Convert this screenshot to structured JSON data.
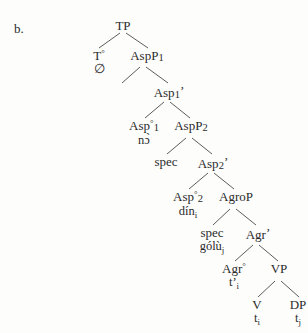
{
  "figure": {
    "example_label": "b.",
    "top_remnant": "",
    "type": "syntactic-tree"
  },
  "nodes": {
    "tp": {
      "label": "TP"
    },
    "t_head": {
      "label": "T",
      "degree": "°",
      "lexical": "∅"
    },
    "aspp1": {
      "label": "AspP",
      "number": "1"
    },
    "spec1": {
      "label": "spec"
    },
    "asp1bar": {
      "label": "Asp",
      "number": "1",
      "prime": "’"
    },
    "asp1_head": {
      "label": "Asp",
      "degree": "°",
      "number": "1",
      "lexical": "nɔ̀"
    },
    "aspp2": {
      "label": "AspP",
      "number": "2"
    },
    "spec2": {
      "label": "spec"
    },
    "asp2bar": {
      "label": "Asp",
      "number": "2",
      "prime": "’"
    },
    "asp2_head": {
      "label": "Asp",
      "degree": "°",
      "number": "2",
      "lexical": "dín",
      "lexical_sub": "i"
    },
    "agrop": {
      "label": "AgroP"
    },
    "spec3": {
      "label": "spec",
      "lexical": "gólù",
      "lexical_sub": "j"
    },
    "agrbar": {
      "label": "Agr",
      "prime": "’"
    },
    "agr_head": {
      "label": "Agr",
      "degree": "°",
      "lexical": "t’",
      "lexical_sub": "i"
    },
    "vp": {
      "label": "VP"
    },
    "v_head": {
      "label": "V",
      "lexical": "t",
      "lexical_sub": "i"
    },
    "dp": {
      "label": "DP",
      "lexical": "t",
      "lexical_sub": "j"
    }
  },
  "colors": {
    "ink": "#2b2b2b",
    "branch": "#4a4a4a",
    "page": "#fdfdfc"
  }
}
